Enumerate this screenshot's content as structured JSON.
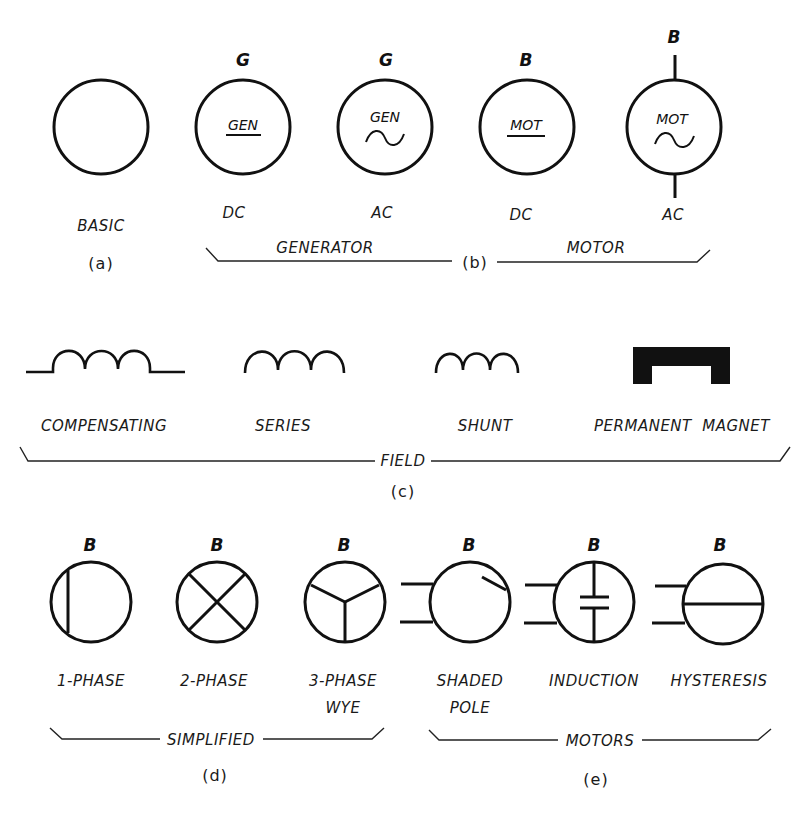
{
  "section_a": {
    "symbol_label": "BASIC",
    "caption": "(a)"
  },
  "section_b": {
    "symbols": [
      {
        "letter": "G",
        "inner_text": "GEN",
        "type_label": "DC",
        "marker": "underline"
      },
      {
        "letter": "G",
        "inner_text": "GEN",
        "type_label": "AC",
        "marker": "sine"
      },
      {
        "letter": "B",
        "inner_text": "MOT",
        "type_label": "DC",
        "marker": "underline"
      },
      {
        "letter": "B",
        "inner_text": "MOT",
        "type_label": "AC",
        "marker": "sine"
      }
    ],
    "group_left": "GENERATOR",
    "group_right": "MOTOR",
    "caption": "(b)"
  },
  "section_c": {
    "symbols": [
      {
        "label": "COMPENSATING",
        "shape": "coil-with-leads"
      },
      {
        "label": "SERIES",
        "shape": "coil"
      },
      {
        "label": "SHUNT",
        "shape": "coil"
      },
      {
        "label": "PERMANENT  MAGNET",
        "shape": "magnet"
      }
    ],
    "group": "FIELD",
    "caption": "(c)"
  },
  "section_d": {
    "symbols": [
      {
        "letter": "B",
        "label_line1": "1-PHASE",
        "label_line2": ""
      },
      {
        "letter": "B",
        "label_line1": "2-PHASE",
        "label_line2": ""
      },
      {
        "letter": "B",
        "label_line1": "3-PHASE",
        "label_line2": "WYE"
      }
    ],
    "group": "SIMPLIFIED",
    "caption": "(d)"
  },
  "section_e": {
    "symbols": [
      {
        "letter": "B",
        "label_line1": "SHADED",
        "label_line2": "POLE"
      },
      {
        "letter": "B",
        "label_line1": "INDUCTION",
        "label_line2": ""
      },
      {
        "letter": "B",
        "label_line1": "HYSTERESIS",
        "label_line2": ""
      }
    ],
    "group": "MOTORS",
    "caption": "(e)"
  }
}
